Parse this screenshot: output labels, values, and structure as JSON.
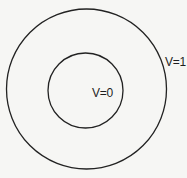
{
  "diagram": {
    "outer_circle": {
      "label": "V=1",
      "cx": 86.5,
      "cy": 89,
      "r": 80
    },
    "inner_circle": {
      "label": "V=0",
      "cx": 85.5,
      "cy": 90.5,
      "r": 37.5
    },
    "colors": {
      "background": "#f6f6f4",
      "stroke": "#222222",
      "text": "#1e1e1e"
    }
  }
}
